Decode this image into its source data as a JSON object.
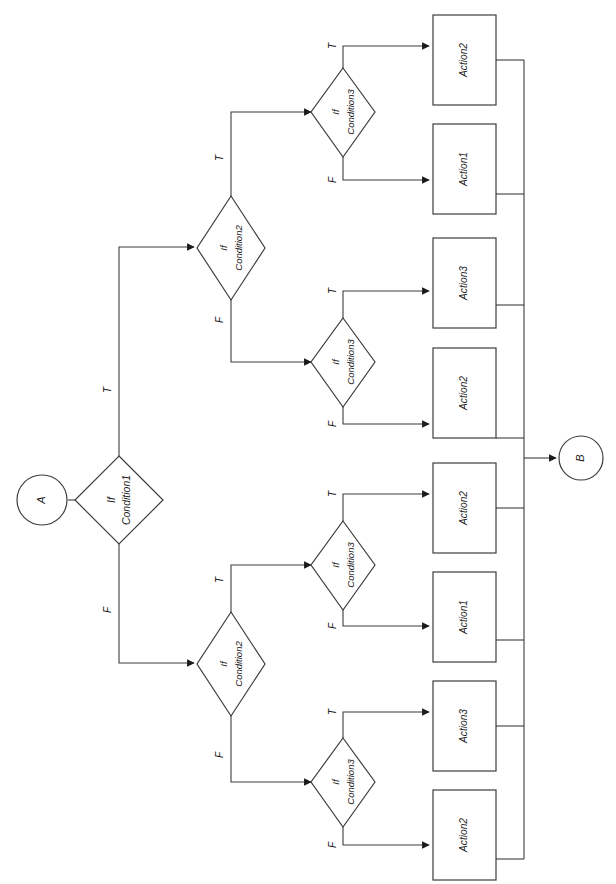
{
  "diagram": {
    "orientation": "rotated-90-ccw",
    "background_color": "#ffffff",
    "line_color": "#3d3d3d",
    "shape_fill": "#ffffff"
  },
  "terminals": {
    "start": {
      "label": "A",
      "shape": "circle"
    },
    "end": {
      "label": "B",
      "shape": "circle"
    }
  },
  "decisions": {
    "condition1": {
      "line1": "If",
      "line2": "Condition1"
    },
    "condition2_true": {
      "line1": "If",
      "line2": "Condition2"
    },
    "condition2_false": {
      "line1": "If",
      "line2": "Condition2"
    },
    "condition3_a": {
      "line1": "If",
      "line2": "Condition3"
    },
    "condition3_b": {
      "line1": "If",
      "line2": "Condition3"
    },
    "condition3_c": {
      "line1": "If",
      "line2": "Condition3"
    },
    "condition3_d": {
      "line1": "If",
      "line2": "Condition3"
    }
  },
  "branch_labels": {
    "c1_true": "T",
    "c1_false": "F",
    "c2t_true": "T",
    "c2t_false": "F",
    "c2f_true": "T",
    "c2f_false": "F",
    "c3a_true": "T",
    "c3a_false": "F",
    "c3b_true": "T",
    "c3b_false": "F",
    "c3c_true": "T",
    "c3c_false": "F",
    "c3d_true": "T",
    "c3d_false": "F"
  },
  "actions": [
    {
      "id": "action_1",
      "label": "Action2"
    },
    {
      "id": "action_2",
      "label": "Action1"
    },
    {
      "id": "action_3",
      "label": "Action3"
    },
    {
      "id": "action_4",
      "label": "Action2"
    },
    {
      "id": "action_5",
      "label": "Action2"
    },
    {
      "id": "action_6",
      "label": "Action1"
    },
    {
      "id": "action_7",
      "label": "Action3"
    },
    {
      "id": "action_8",
      "label": "Action2"
    }
  ]
}
